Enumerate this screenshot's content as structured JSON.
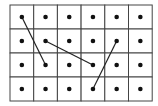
{
  "diagram": {
    "type": "dot-grid",
    "columns": 6,
    "rows": 4,
    "origin": {
      "x": 10,
      "y": 5
    },
    "cell_width": 23.7,
    "cell_height": 24,
    "grid_color": "#444444",
    "dot_color": "#111111",
    "line_color": "#222222",
    "segments": [
      {
        "from": {
          "col": 0,
          "row": 0
        },
        "to": {
          "col": 1,
          "row": 2
        }
      },
      {
        "from": {
          "col": 1,
          "row": 1
        },
        "to": {
          "col": 3,
          "row": 2
        }
      },
      {
        "from": {
          "col": 4,
          "row": 1
        },
        "to": {
          "col": 3,
          "row": 3
        }
      }
    ]
  }
}
